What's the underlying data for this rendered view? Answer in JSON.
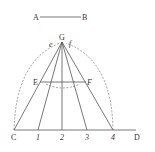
{
  "figure": {
    "segment_labels": {
      "start": "A",
      "end": "B"
    },
    "apex_label": "G",
    "apex_side_labels": {
      "left": "e",
      "right": "f"
    },
    "cross_labels": {
      "left": "E",
      "right": "F"
    },
    "baseline_labels": [
      "C",
      "1",
      "2",
      "3",
      "4",
      "D"
    ],
    "colors": {
      "ink": "#555555",
      "background": "#ffffff"
    }
  }
}
